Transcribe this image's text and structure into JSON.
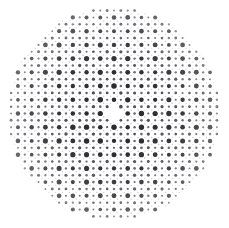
{
  "figure": {
    "width": 229,
    "height": 228,
    "background_color": "#ffffff"
  },
  "chart_data": {
    "type": "scatter",
    "title": "",
    "subtitle": "",
    "xlabel": "",
    "ylabel": "",
    "xlim": [
      0,
      229
    ],
    "ylim": [
      0,
      228
    ],
    "grid": false,
    "legend": null,
    "annotations": [],
    "aperture": {
      "shape": "circle",
      "center_x": 114.0,
      "center_y": 113.5,
      "radius": 106.0
    },
    "lattice": {
      "type": "square",
      "period_x": 13.72,
      "period_y": 13.72,
      "origin_x": 114.0,
      "origin_y": 113.5,
      "columns": 17,
      "rows": 17
    },
    "center_gap": {
      "enabled": true,
      "radius": 7.0
    },
    "point_classes": [
      {
        "name": "primary-node",
        "offset_x": 0.0,
        "offset_y": 0.0,
        "diameter": 5.0,
        "color": "#2b2b2f",
        "opacity": 1.0,
        "count_description": "one per lattice cell corner"
      },
      {
        "name": "secondary-edge-horizontal",
        "offset_x": 0.5,
        "offset_y": 0.0,
        "diameter": 2.6,
        "color": "#4a4a50",
        "opacity": 0.85,
        "count_description": "midpoint of horizontal cell edges"
      },
      {
        "name": "secondary-edge-vertical",
        "offset_x": 0.0,
        "offset_y": 0.5,
        "diameter": 2.6,
        "color": "#4a4a50",
        "opacity": 0.85,
        "count_description": "midpoint of vertical cell edges"
      },
      {
        "name": "tertiary-diagonal",
        "offset_x": 0.5,
        "offset_y": 0.5,
        "diameter": 3.2,
        "color": "#3a3a40",
        "opacity": 0.9,
        "count_description": "cell centers"
      },
      {
        "name": "quaternary-faint",
        "offset_x": 0.25,
        "offset_y": 0.25,
        "diameter": 1.5,
        "color": "#8e8e96",
        "opacity": 0.55,
        "count_description": "quarter-position fill dots"
      },
      {
        "name": "quaternary-faint-alt",
        "offset_x": 0.75,
        "offset_y": 0.25,
        "diameter": 1.4,
        "color": "#9a9aa2",
        "opacity": 0.5,
        "count_description": "quarter-position fill dots"
      },
      {
        "name": "quaternary-faint-low",
        "offset_x": 0.25,
        "offset_y": 0.75,
        "diameter": 1.4,
        "color": "#9a9aa2",
        "opacity": 0.5,
        "count_description": "quarter-position fill dots"
      },
      {
        "name": "quaternary-faint-low-alt",
        "offset_x": 0.75,
        "offset_y": 0.75,
        "diameter": 1.5,
        "color": "#8e8e96",
        "opacity": 0.55,
        "count_description": "quarter-position fill dots"
      },
      {
        "name": "micro-speckle",
        "offset_x": 0.5,
        "offset_y": 0.25,
        "diameter": 1.0,
        "color": "#b4b4bb",
        "opacity": 0.45,
        "count_description": "faint speckle between rows"
      },
      {
        "name": "micro-speckle-alt",
        "offset_x": 0.25,
        "offset_y": 0.5,
        "diameter": 1.0,
        "color": "#b4b4bb",
        "opacity": 0.45,
        "count_description": "faint speckle between columns"
      }
    ],
    "radial_falloff": {
      "enabled": true,
      "description": "dot size and opacity decrease slightly toward the aperture rim",
      "edge_scale": 0.82,
      "edge_opacity": 0.7
    },
    "colors": {
      "dot_dark": "#2b2b2f",
      "dot_mid": "#4a4a50",
      "dot_light": "#8e8e96",
      "dot_faint": "#b4b4bb",
      "background": "#ffffff"
    }
  }
}
